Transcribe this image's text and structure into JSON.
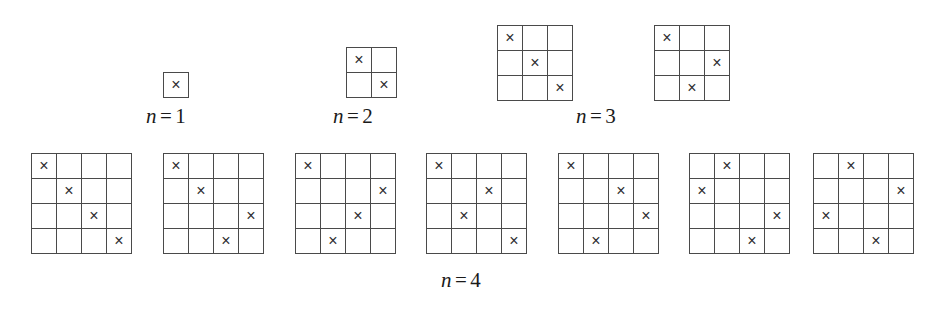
{
  "figure": {
    "mark_glyph": "×",
    "line_color": "#4a4a4a",
    "background_color": "#ffffff",
    "text_color": "#1a1a1a"
  },
  "groups": [
    {
      "id": "n1",
      "label": {
        "variable": "n",
        "equals": "=",
        "value": "1"
      },
      "size": 1,
      "cell_px": 25,
      "label_left": 146,
      "label_top": 104,
      "grids": [
        {
          "x": 163,
          "y": 72,
          "marks": [
            [
              1,
              1
            ]
          ]
        }
      ]
    },
    {
      "id": "n2",
      "label": {
        "variable": "n",
        "equals": "=",
        "value": "2"
      },
      "size": 2,
      "cell_px": 25,
      "label_left": 333,
      "label_top": 104,
      "grids": [
        {
          "x": 346,
          "y": 47,
          "marks": [
            [
              1,
              1
            ],
            [
              2,
              2
            ]
          ]
        }
      ]
    },
    {
      "id": "n3",
      "label": {
        "variable": "n",
        "equals": "=",
        "value": "3"
      },
      "size": 3,
      "cell_px": 25,
      "label_left": 576,
      "label_top": 104,
      "grids": [
        {
          "x": 497,
          "y": 25,
          "marks": [
            [
              1,
              1
            ],
            [
              2,
              2
            ],
            [
              3,
              3
            ]
          ]
        },
        {
          "x": 654,
          "y": 25,
          "marks": [
            [
              1,
              1
            ],
            [
              2,
              3
            ],
            [
              3,
              2
            ]
          ]
        }
      ]
    },
    {
      "id": "n4",
      "label": {
        "variable": "n",
        "equals": "=",
        "value": "4"
      },
      "size": 4,
      "cell_px": 25,
      "label_left": 441,
      "label_top": 268,
      "grids": [
        {
          "x": 31,
          "y": 153,
          "marks": [
            [
              1,
              1
            ],
            [
              2,
              2
            ],
            [
              3,
              3
            ],
            [
              4,
              4
            ]
          ]
        },
        {
          "x": 163,
          "y": 153,
          "marks": [
            [
              1,
              1
            ],
            [
              2,
              2
            ],
            [
              3,
              4
            ],
            [
              4,
              3
            ]
          ]
        },
        {
          "x": 295,
          "y": 153,
          "marks": [
            [
              1,
              1
            ],
            [
              2,
              4
            ],
            [
              3,
              3
            ],
            [
              4,
              2
            ]
          ]
        },
        {
          "x": 426,
          "y": 153,
          "marks": [
            [
              1,
              1
            ],
            [
              2,
              3
            ],
            [
              3,
              2
            ],
            [
              4,
              4
            ]
          ]
        },
        {
          "x": 558,
          "y": 153,
          "marks": [
            [
              1,
              1
            ],
            [
              2,
              3
            ],
            [
              3,
              4
            ],
            [
              4,
              2
            ]
          ]
        },
        {
          "x": 689,
          "y": 153,
          "marks": [
            [
              1,
              2
            ],
            [
              2,
              1
            ],
            [
              3,
              4
            ],
            [
              4,
              3
            ]
          ]
        },
        {
          "x": 813,
          "y": 153,
          "marks": [
            [
              1,
              2
            ],
            [
              2,
              4
            ],
            [
              3,
              1
            ],
            [
              4,
              3
            ]
          ]
        }
      ]
    }
  ]
}
